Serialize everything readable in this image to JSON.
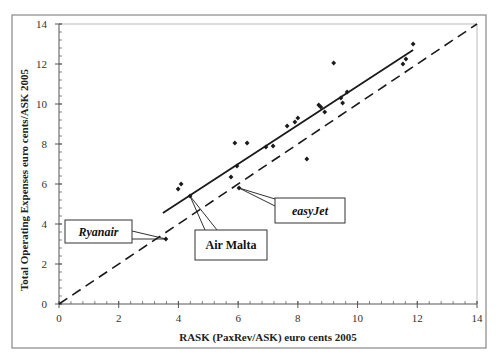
{
  "chart_data": {
    "type": "scatter",
    "title": "",
    "xlabel": "RASK (PaxRev/ASK) euro cents 2005",
    "ylabel": "Total Operating Expenses euro cents/ASK 2005",
    "xlim": [
      0,
      14
    ],
    "ylim": [
      0,
      14
    ],
    "xticks": [
      0,
      2,
      4,
      6,
      8,
      10,
      12,
      14
    ],
    "yticks": [
      0,
      2,
      4,
      6,
      8,
      10,
      12,
      14
    ],
    "grid": false,
    "legend": null,
    "series": [
      {
        "name": "Airlines",
        "marker": "diamond",
        "points": [
          {
            "x": 3.58,
            "y": 3.25,
            "label": "Ryanair"
          },
          {
            "x": 3.99,
            "y": 5.75
          },
          {
            "x": 4.09,
            "y": 6.0
          },
          {
            "x": 4.39,
            "y": 5.4,
            "label": "Air Malta"
          },
          {
            "x": 5.76,
            "y": 6.35
          },
          {
            "x": 5.89,
            "y": 8.05
          },
          {
            "x": 5.96,
            "y": 6.9
          },
          {
            "x": 6.03,
            "y": 5.8,
            "label": "easyJet"
          },
          {
            "x": 6.3,
            "y": 8.05
          },
          {
            "x": 6.93,
            "y": 7.85
          },
          {
            "x": 7.17,
            "y": 7.9
          },
          {
            "x": 7.64,
            "y": 8.9
          },
          {
            "x": 7.9,
            "y": 9.1
          },
          {
            "x": 8.0,
            "y": 9.3
          },
          {
            "x": 8.3,
            "y": 7.25
          },
          {
            "x": 8.7,
            "y": 9.95
          },
          {
            "x": 8.77,
            "y": 9.85
          },
          {
            "x": 8.9,
            "y": 9.6
          },
          {
            "x": 9.2,
            "y": 12.05
          },
          {
            "x": 9.44,
            "y": 10.3
          },
          {
            "x": 9.5,
            "y": 10.05
          },
          {
            "x": 9.65,
            "y": 10.6
          },
          {
            "x": 11.52,
            "y": 12.0
          },
          {
            "x": 11.62,
            "y": 12.25
          },
          {
            "x": 11.86,
            "y": 13.0
          }
        ]
      }
    ],
    "lines": [
      {
        "name": "Trend line",
        "style": "solid",
        "from": [
          3.48,
          4.55
        ],
        "to": [
          11.86,
          12.7
        ]
      },
      {
        "name": "Break-even (y = x)",
        "style": "dashed",
        "from": [
          0,
          0
        ],
        "to": [
          14,
          14
        ]
      }
    ],
    "annotations": [
      {
        "text": "Ryanair",
        "italic": true,
        "box": [
          65,
          220,
          67,
          23
        ],
        "anchor": [
          166,
          239
        ],
        "attach": [
          [
            132,
            231
          ],
          [
            132,
            239
          ]
        ]
      },
      {
        "text": "Air Malta",
        "italic": false,
        "box": [
          195,
          230,
          72,
          30
        ],
        "anchor": [
          190,
          196
        ],
        "attach": [
          [
            205,
            230
          ],
          [
            217,
            230
          ]
        ]
      },
      {
        "text": "easyJet",
        "italic": true,
        "box": [
          275,
          198,
          70,
          25
        ],
        "anchor": [
          239,
          188
        ],
        "attach": [
          [
            275,
            199
          ],
          [
            275,
            206
          ]
        ]
      }
    ]
  },
  "layout": {
    "frame": [
      12,
      15,
      474,
      333
    ],
    "plot": {
      "x0": 59,
      "x1": 477,
      "y0": 304,
      "y1": 24
    },
    "colors": {
      "ink": "#1a1a1a",
      "frame": "#888888",
      "axis": "#555555"
    }
  }
}
